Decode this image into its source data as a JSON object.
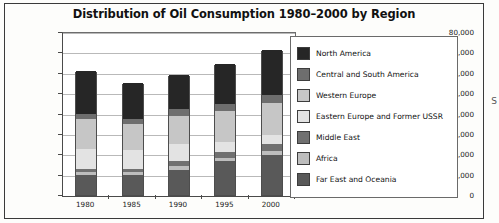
{
  "page": {
    "edge_letter": "S"
  },
  "chart_data": {
    "type": "bar",
    "stacked": true,
    "title": "Distribution of Oil Consumption 1980–2000 by Region",
    "xlabel": "",
    "ylabel": "",
    "categories": [
      "1980",
      "1985",
      "1990",
      "1995",
      "2000"
    ],
    "ylim": [
      0,
      80000
    ],
    "ytick_labels": [
      "0",
      "10,000",
      "20,000",
      "30,000",
      "40,000",
      "50,000",
      "60,000",
      "70,000",
      "80,000"
    ],
    "ytick_values": [
      0,
      10000,
      20000,
      30000,
      40000,
      50000,
      60000,
      70000,
      80000
    ],
    "grid": true,
    "legend_position": "right",
    "totals": [
      61000,
      55000,
      59000,
      64500,
      71000
    ],
    "series": [
      {
        "name": "Far East and Oceania",
        "color": "#595959",
        "values": [
          10000,
          10000,
          12500,
          16500,
          19500
        ]
      },
      {
        "name": "Africa",
        "color": "#bdbdbd",
        "values": [
          1200,
          1200,
          1500,
          1700,
          2200
        ]
      },
      {
        "name": "Middle East",
        "color": "#707070",
        "values": [
          1800,
          1800,
          2500,
          2800,
          3300
        ]
      },
      {
        "name": "Eastern Europe and Former USSR",
        "color": "#e3e3e3",
        "values": [
          9500,
          9000,
          8500,
          5000,
          4500
        ]
      },
      {
        "name": "Western Europe",
        "color": "#c6c6c6",
        "values": [
          15000,
          13000,
          14000,
          15000,
          15500
        ]
      },
      {
        "name": "Central and South America",
        "color": "#6e6e6e",
        "values": [
          2500,
          2500,
          3000,
          3500,
          4000
        ]
      },
      {
        "name": "North America",
        "color": "#262626",
        "values": [
          21000,
          17500,
          17000,
          20000,
          22000
        ]
      }
    ],
    "legend_entries": [
      {
        "label": "North America",
        "color": "#262626"
      },
      {
        "label": "Central and South America",
        "color": "#6e6e6e"
      },
      {
        "label": "Western Europe",
        "color": "#c6c6c6"
      },
      {
        "label": "Eastern Europe and Former USSR",
        "color": "#e3e3e3"
      },
      {
        "label": "Middle East",
        "color": "#707070"
      },
      {
        "label": "Africa",
        "color": "#bdbdbd"
      },
      {
        "label": "Far East and Oceania",
        "color": "#595959"
      }
    ]
  }
}
